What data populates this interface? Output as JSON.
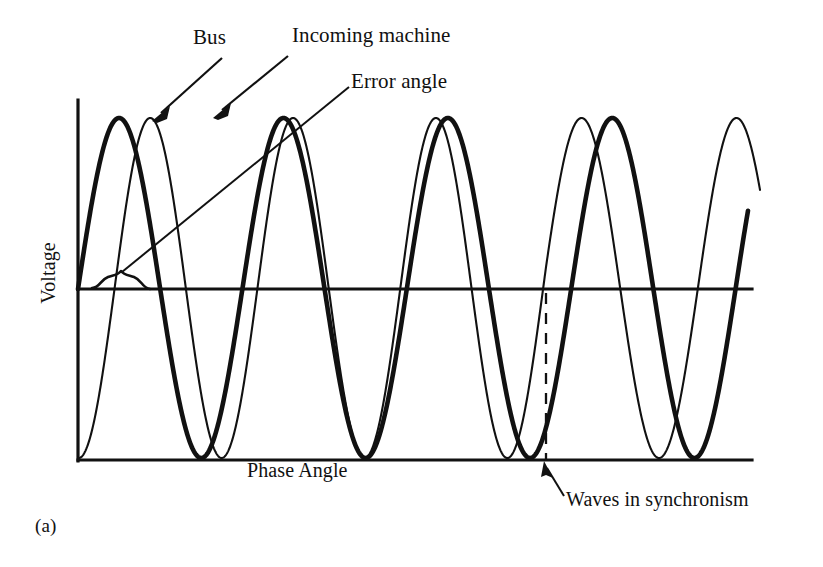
{
  "figure": {
    "caption": "(a)",
    "axes": {
      "ylabel": "Voltage",
      "xlabel": "Phase Angle"
    },
    "annotations": {
      "bus": "Bus",
      "incoming_machine": "Incoming machine",
      "error_angle": "Error angle",
      "waves_in_synchronism": "Waves in synchronism"
    },
    "colors": {
      "ink": "#111111",
      "background": "#ffffff"
    }
  },
  "chart_data": {
    "type": "line",
    "title": "",
    "xlabel": "Phase Angle",
    "ylabel": "Voltage",
    "grid": false,
    "legend": "annotated-callouts",
    "xlim": [
      0,
      4.6
    ],
    "ylim": [
      -1,
      1
    ],
    "series": [
      {
        "name": "Bus",
        "style": "thick",
        "linewidth": 4,
        "phase_deg": 0,
        "amplitude": 1,
        "cycles": 4.1,
        "peaks_x_px": [
          152,
          378,
          597
        ],
        "troughs_x_px": [
          268,
          487,
          700
        ]
      },
      {
        "name": "Incoming machine",
        "style": "thin",
        "linewidth": 2,
        "phase_deg_start": -92,
        "phase_deg_end": 0,
        "amplitude": 1,
        "cycles": 4.35,
        "peaks_x_px": [
          212,
          400,
          605
        ],
        "troughs_x_px": [
          113,
          300,
          500,
          706
        ]
      }
    ],
    "markers": [
      {
        "name": "error-angle-brace",
        "label": "Error angle",
        "x_px_from": 93,
        "x_px_to": 140,
        "y_px": 278,
        "meaning": "phase lag between the two waves at the first zero crossing"
      },
      {
        "name": "synchronism-line",
        "label": "Waves in synchronism",
        "x_px": 546,
        "y_px_from": 292,
        "y_px_to": 460,
        "style": "dashed",
        "meaning": "phase difference has fallen to zero"
      }
    ]
  }
}
